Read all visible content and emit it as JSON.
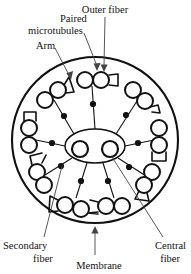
{
  "figure": {
    "background_color": "#ffffff",
    "ink_color": "#111111",
    "leader_color": "#444444"
  },
  "labels": {
    "paired_microtubules": "Paired\nmicrotubules",
    "paired_microtubules_line1": "Paired",
    "paired_microtubules_line2": "microtubules",
    "outer_fiber": "Outer fiber",
    "arm": "Arm",
    "secondary_fiber_line1": "Secondary",
    "secondary_fiber_line2": "fiber",
    "central_fiber_line1": "Central",
    "central_fiber_line2": "fiber",
    "membrane": "Membrane"
  },
  "structure": {
    "membrane": {
      "cx": 95,
      "cy": 140,
      "r": 83
    },
    "central_sheath": {
      "cx": 95,
      "cy": 146,
      "rx": 30,
      "ry": 17
    },
    "central_fibers": [
      {
        "cx": 80,
        "cy": 149,
        "r": 8
      },
      {
        "cx": 110,
        "cy": 149,
        "r": 8
      }
    ],
    "outer_doublet_count": 9,
    "spoke_head_count": 9,
    "doublets": [
      {
        "index": 1,
        "angle_deg": -90,
        "cx": 92,
        "cy": 79,
        "label": "top"
      },
      {
        "index": 2,
        "angle_deg": -50,
        "cx": 140,
        "cy": 95,
        "label": "upper-right"
      },
      {
        "index": 3,
        "angle_deg": -10,
        "cx": 160,
        "cy": 137,
        "label": "right"
      },
      {
        "index": 4,
        "angle_deg": 30,
        "cx": 150,
        "cy": 181,
        "label": "lower-right"
      },
      {
        "index": 5,
        "angle_deg": 70,
        "cx": 113,
        "cy": 205,
        "label": "bottom-right"
      },
      {
        "index": 6,
        "angle_deg": 110,
        "cx": 71,
        "cy": 205,
        "label": "bottom-left"
      },
      {
        "index": 7,
        "angle_deg": 150,
        "cx": 38,
        "cy": 178,
        "label": "lower-left"
      },
      {
        "index": 8,
        "angle_deg": 190,
        "cx": 28,
        "cy": 134,
        "label": "left"
      },
      {
        "index": 9,
        "angle_deg": 230,
        "cx": 50,
        "cy": 93,
        "label": "upper-left"
      }
    ]
  },
  "callouts": [
    {
      "name": "paired-microtubules",
      "text_x": 62,
      "text_y": 24,
      "target_x": 96,
      "target_y": 68
    },
    {
      "name": "outer-fiber",
      "text_x": 135,
      "text_y": 13,
      "target_x": 104,
      "target_y": 70
    },
    {
      "name": "arm",
      "text_x": 56,
      "text_y": 48,
      "target_x": 70,
      "target_y": 80
    },
    {
      "name": "secondary-fiber",
      "text_x": 38,
      "text_y": 248,
      "target_x": 63,
      "target_y": 165
    },
    {
      "name": "central-fiber",
      "text_x": 164,
      "text_y": 248,
      "target_x": 112,
      "target_y": 156
    },
    {
      "name": "membrane",
      "text_x": 99,
      "text_y": 269,
      "target_x": 95,
      "target_y": 226
    }
  ]
}
